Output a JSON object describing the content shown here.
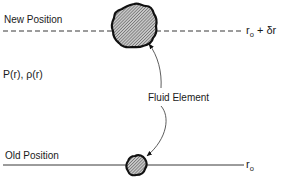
{
  "diagram": {
    "type": "physics-schematic",
    "labels": {
      "new_position": "New Position",
      "old_position": "Old Position",
      "pressure_density": "P(r), ρ(r)",
      "fluid_element": "Fluid Element",
      "r0_symbol": "r",
      "r0_sub": "o",
      "new_radius_suffix": "+ δr"
    },
    "lines": [
      {
        "name": "new-position-line",
        "style": "dashed",
        "y": 31,
        "x_start": 3,
        "x_end": 244
      },
      {
        "name": "old-position-line",
        "style": "solid",
        "y": 165,
        "x_start": 3,
        "x_end": 244
      }
    ],
    "elements": [
      {
        "name": "expanded-fluid-element",
        "cx": 134,
        "cy": 26,
        "r": 22,
        "fill": "hatched-gray"
      },
      {
        "name": "original-fluid-element",
        "cx": 136,
        "cy": 165,
        "r": 10,
        "fill": "hatched-gray"
      }
    ],
    "arrow": {
      "from": "original-fluid-element",
      "to": "expanded-fluid-element",
      "heads": "both",
      "curved": true
    },
    "colors": {
      "ink": "#111111",
      "hatch": "#555555",
      "background": "#ffffff"
    }
  }
}
